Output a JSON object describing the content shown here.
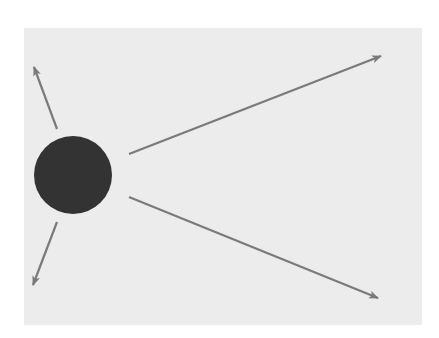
{
  "diagram": {
    "type": "radiating-arrows",
    "background_color": "#ececec",
    "page_color": "#ffffff",
    "panel": {
      "x": 24,
      "y": 28,
      "width": 398,
      "height": 297
    },
    "center_body": {
      "shape": "circle",
      "cx": 73,
      "cy": 175,
      "r": 39,
      "color": "#333333"
    },
    "arrow_color": "#7a7a7a",
    "arrows": [
      {
        "name": "upper-left",
        "x1": 57,
        "y1": 129,
        "x2": 34,
        "y2": 67
      },
      {
        "name": "lower-left",
        "x1": 57,
        "y1": 222,
        "x2": 33,
        "y2": 285
      },
      {
        "name": "upper-right",
        "x1": 129,
        "y1": 154,
        "x2": 381,
        "y2": 56
      },
      {
        "name": "lower-right",
        "x1": 129,
        "y1": 197,
        "x2": 378,
        "y2": 298
      }
    ]
  }
}
